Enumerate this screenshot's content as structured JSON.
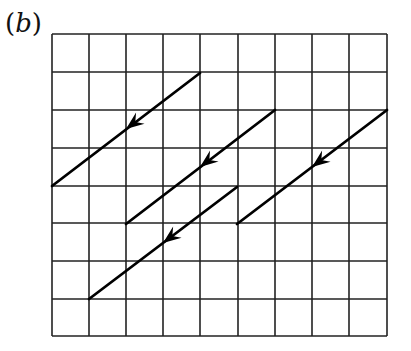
{
  "figure": {
    "label": "(b)",
    "top_partial_text": "... ."
  },
  "grid": {
    "columns": 9,
    "rows": 8,
    "x_lines": [
      52,
      89,
      126,
      163,
      200,
      238,
      275,
      312,
      349,
      387
    ],
    "y_lines": [
      34,
      72,
      110,
      148,
      186,
      223,
      261,
      299,
      336
    ],
    "line_color": "#222222"
  },
  "arrows": [
    {
      "from": [
        200,
        73
      ],
      "to": [
        52,
        186
      ],
      "direction": "down-left",
      "head": [
        126,
        129
      ]
    },
    {
      "from": [
        275,
        110
      ],
      "to": [
        126,
        224
      ],
      "direction": "down-left",
      "head": [
        200,
        167
      ]
    },
    {
      "from": [
        237,
        187
      ],
      "to": [
        89,
        299
      ],
      "direction": "down-left",
      "head": [
        163,
        243
      ]
    },
    {
      "from": [
        387,
        110
      ],
      "to": [
        237,
        224
      ],
      "direction": "down-left",
      "head": [
        312,
        167
      ]
    }
  ],
  "arrow_color": "#000000"
}
